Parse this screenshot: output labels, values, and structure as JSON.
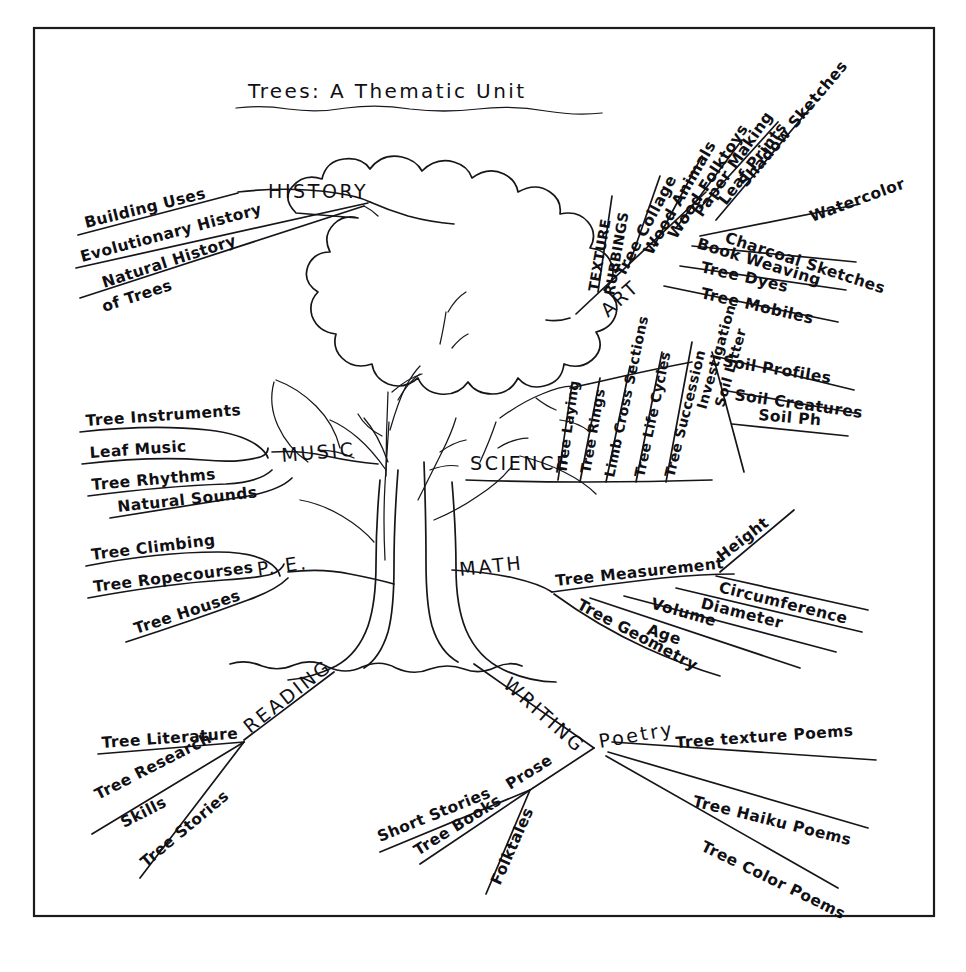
{
  "document": {
    "title": "Trees: A Thematic Unit",
    "type": "hand-drawn mind map",
    "center_image": "tree-drawing",
    "border": "thin black rectangular frame",
    "ink_color": "#15151a",
    "paper_color": "#ffffff"
  },
  "branches": [
    {
      "id": "history",
      "label": "HISTORY",
      "position": "upper-left",
      "items": [
        "Building Uses",
        "Evolutionary History",
        "Natural History of Trees"
      ]
    },
    {
      "id": "art",
      "label": "ART",
      "position": "upper-right",
      "items": [
        "Texture Rubbings",
        "Tree Collage",
        "Wood Animals",
        "Wood Folktoys",
        "Paper Making",
        "Leaf Prints",
        "Shadow Sketches",
        "Watercolor",
        "Charcoal Sketches",
        "Book Weaving",
        "Tree Dyes",
        "Tree Mobiles"
      ]
    },
    {
      "id": "music",
      "label": "MUSIC",
      "position": "mid-left",
      "items": [
        "Tree Instruments",
        "Leaf Music",
        "Tree Rhythms",
        "Natural Sounds"
      ]
    },
    {
      "id": "science",
      "label": "SCIENCE",
      "position": "mid-right",
      "items": [
        "Tree Laying",
        "Tree Rings",
        "Limb Cross Sections",
        "Tree Life Cycles",
        "Tree Succession"
      ],
      "subgroups": [
        {
          "label": "Soil Litter Investigation",
          "items": [
            "Soil Profiles",
            "Soil Creatures",
            "Soil Ph"
          ]
        }
      ]
    },
    {
      "id": "pe",
      "label": "P. E.",
      "position": "lower-left",
      "items": [
        "Tree Climbing",
        "Tree Ropecourses",
        "Tree Houses"
      ]
    },
    {
      "id": "math",
      "label": "MATH",
      "position": "lower-right",
      "items": [
        "Tree Measurement",
        "Tree Geometry"
      ],
      "subgroups": [
        {
          "label": "Tree Measurement",
          "items": [
            "Height",
            "Circumference",
            "Diameter",
            "Volume",
            "Age"
          ]
        }
      ]
    },
    {
      "id": "reading",
      "label": "READING",
      "position": "root-left",
      "items": [
        "Tree Literature",
        "Tree Research Skills",
        "Tree Stories"
      ]
    },
    {
      "id": "writing",
      "label": "WRITING",
      "position": "root-right",
      "items": [
        "Prose",
        "Poetry"
      ],
      "subgroups": [
        {
          "label": "Prose",
          "items": [
            "Short Stories",
            "Tree Books",
            "Folktales"
          ]
        },
        {
          "label": "Poetry",
          "items": [
            "Tree texture Poems",
            "Tree Haiku Poems",
            "Tree Color Poems"
          ]
        }
      ]
    }
  ],
  "labels": {
    "title": "Trees: A Thematic Unit",
    "history": "HISTORY",
    "art": "ART",
    "music": "MUSIC",
    "science": "SCIENCE",
    "pe": "P. E.",
    "math": "MATH",
    "reading": "READING",
    "writing": "WRITING",
    "prose": "Prose",
    "poetry": "Poetry",
    "tree_measurement": "Tree Measurement",
    "tree_geometry": "Tree Geometry",
    "soil_investigation_a": "Soil Litter",
    "soil_investigation_b": "Investigation",
    "history_1": "Building Uses",
    "history_2": "Evolutionary History",
    "history_3a": "Natural History",
    "history_3b": "of Trees",
    "art_1a": "TEXTURE",
    "art_1b": "RUBBINGS",
    "art_2": "Tree Collage",
    "art_3": "Wood Animals",
    "art_4": "Wood Folktoys",
    "art_5": "Paper Making",
    "art_6": "Leaf Prints",
    "art_7": "Shadow Sketches",
    "art_8": "Watercolor",
    "art_9": "Charcoal Sketches",
    "art_10": "Book Weaving",
    "art_11": "Tree Dyes",
    "art_12": "Tree Mobiles",
    "music_1": "Tree Instruments",
    "music_2": "Leaf Music",
    "music_3": "Tree Rhythms",
    "music_4": "Natural Sounds",
    "science_1": "Tree Laying",
    "science_2": "Tree Rings",
    "science_3": "Limb Cross Sections",
    "science_4": "Tree Life Cycles",
    "science_5": "Tree Succession",
    "soil_1": "Soil Profiles",
    "soil_2": "Soil Creatures",
    "soil_3": "Soil Ph",
    "pe_1": "Tree Climbing",
    "pe_2": "Tree Ropecourses",
    "pe_3": "Tree Houses",
    "math_1": "Height",
    "math_2": "Circumference",
    "math_3": "Diameter",
    "math_4": "Volume",
    "math_5": "Age",
    "reading_1": "Tree Literature",
    "reading_2a": "Tree Research",
    "reading_2b": "Skills",
    "reading_3": "Tree Stories",
    "writing_1": "Short Stories",
    "writing_2": "Tree Books",
    "writing_3": "Folktales",
    "poetry_1": "Tree texture Poems",
    "poetry_2": "Tree Haiku Poems",
    "poetry_3": "Tree Color Poems"
  }
}
